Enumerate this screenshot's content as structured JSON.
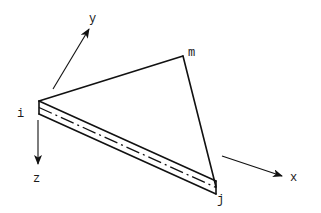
{
  "figure": {
    "type": "triangular plate element with local axes",
    "nodes": [
      {
        "id": "i",
        "label": "i"
      },
      {
        "id": "m",
        "label": "m"
      },
      {
        "id": "j",
        "label": "j"
      }
    ],
    "axes": [
      {
        "id": "x",
        "label": "x"
      },
      {
        "id": "y",
        "label": "y"
      },
      {
        "id": "z",
        "label": "z"
      }
    ],
    "colors": {
      "line": "#111111",
      "text": "#1a1a1a",
      "background": "#ffffff"
    }
  }
}
